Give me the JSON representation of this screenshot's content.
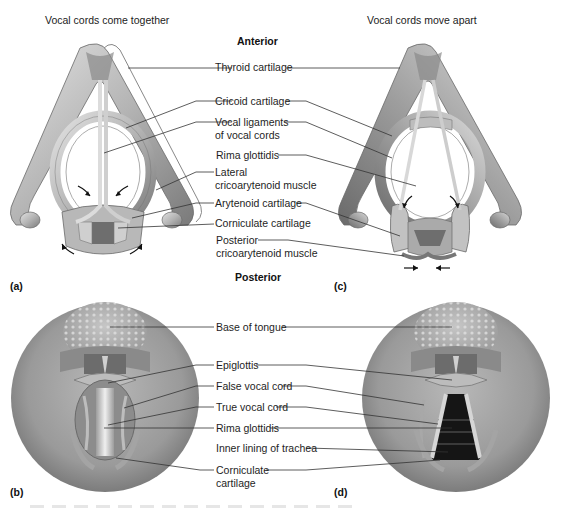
{
  "figure": {
    "top_section": {
      "left_title": "Vocal cords come together",
      "right_title": "Vocal cords move apart",
      "orientation_top": "Anterior",
      "orientation_bottom": "Posterior",
      "panel_labels": {
        "a": "(a)",
        "c": "(c)"
      },
      "labels": [
        {
          "id": "thyroid",
          "text": "Thyroid cartilage"
        },
        {
          "id": "cricoid",
          "text": "Cricoid cartilage"
        },
        {
          "id": "vocal-ligaments",
          "line1": "Vocal ligaments",
          "line2": "of vocal cords"
        },
        {
          "id": "rima-glottidis",
          "text": "Rima glottidis"
        },
        {
          "id": "lateral-cricoarytenoid",
          "line1": "Lateral",
          "line2": "cricoarytenoid muscle"
        },
        {
          "id": "arytenoid",
          "text": "Arytenoid cartilage"
        },
        {
          "id": "corniculate",
          "text": "Corniculate cartilage"
        },
        {
          "id": "posterior-cricoarytenoid",
          "line1": "Posterior",
          "line2": "cricoarytenoid muscle"
        }
      ]
    },
    "bottom_section": {
      "panel_labels": {
        "b": "(b)",
        "d": "(d)"
      },
      "labels": [
        {
          "id": "base-of-tongue",
          "text": "Base of tongue"
        },
        {
          "id": "epiglottis",
          "text": "Epiglottis"
        },
        {
          "id": "false-vocal-cord",
          "text": "False vocal cord"
        },
        {
          "id": "true-vocal-cord",
          "text": "True vocal cord"
        },
        {
          "id": "rima-glottidis",
          "text": "Rima glottidis"
        },
        {
          "id": "inner-lining-trachea",
          "text": "Inner lining of trachea"
        },
        {
          "id": "corniculate",
          "line1": "Corniculate",
          "line2": "cartilage"
        }
      ]
    },
    "colors": {
      "cartilage_light": "#d9d9d9",
      "cartilage_mid": "#a8a8a8",
      "cartilage_dark": "#6e6e6e",
      "leader_line": "#333333",
      "trachea_dark": "#151515",
      "background": "#ffffff"
    }
  }
}
